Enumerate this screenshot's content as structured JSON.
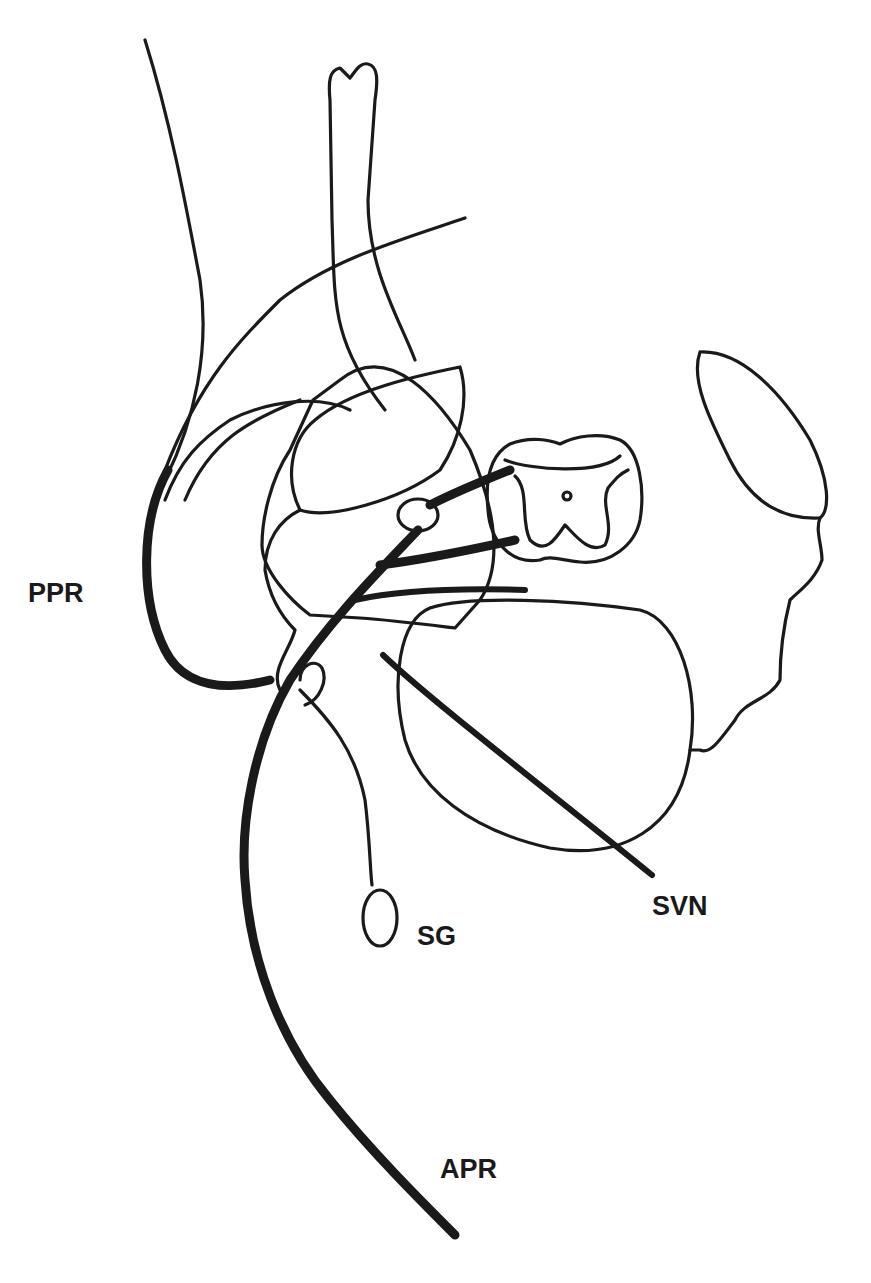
{
  "diagram": {
    "type": "anatomical-line-drawing",
    "labels": {
      "ppr": "PPR",
      "svn": "SVN",
      "sg": "SG",
      "apr": "APR"
    },
    "colors": {
      "ink": "#1a1a1a",
      "background": "#ffffff"
    }
  }
}
